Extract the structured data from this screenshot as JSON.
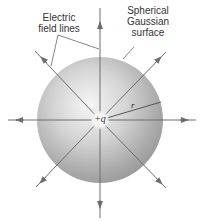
{
  "labels": {
    "field_lines": [
      "Electric",
      "field lines"
    ],
    "surface": [
      "Spherical",
      "Gaussian",
      "surface"
    ],
    "charge": "+q",
    "radius": "r"
  },
  "colors": {
    "sphere_light": "#f4f4f4",
    "sphere_dark": "#9a9a9a",
    "line": "#6e6e6e",
    "text": "#333333"
  },
  "geometry": {
    "center": [
      100,
      120
    ],
    "sphere_radius": 63,
    "field_line_count": 8
  }
}
